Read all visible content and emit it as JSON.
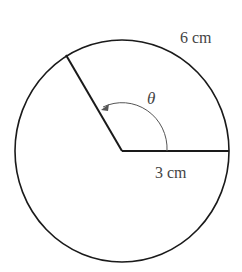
{
  "diagram": {
    "type": "circle-sector",
    "labels": {
      "arc_length": "6 cm",
      "radius": "3 cm",
      "angle": "θ"
    },
    "colors": {
      "stroke": "#1a1a1a",
      "text": "#444444",
      "arc_arrow": "#555555"
    }
  }
}
